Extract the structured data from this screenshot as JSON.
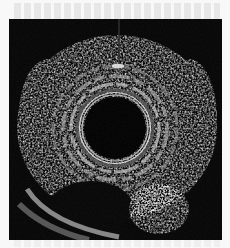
{
  "image": {
    "type": "endoscopic-ultrasound",
    "description": "Radial endoscopic ultrasound showing circular anechoic lumen/balloon with concentric echogenic wall layers and an anechoic oval structure inferiorly",
    "frame": {
      "x": 9,
      "y": 19,
      "width": 213,
      "height": 221
    },
    "colors": {
      "background": "#050505",
      "tissue_bright": "#d8d8d8",
      "tissue_mid": "#7a7a7a",
      "lumen": "#000000",
      "page": "#f8f8f8"
    },
    "features": {
      "lumen_center": {
        "x": 106,
        "y": 109
      },
      "lumen_radius": 31,
      "ring_radii": [
        33,
        36,
        44,
        52,
        62
      ],
      "bright_spot": {
        "x": 109,
        "y": 47
      },
      "inferior_cyst_center": {
        "x": 80,
        "y": 186
      }
    }
  }
}
